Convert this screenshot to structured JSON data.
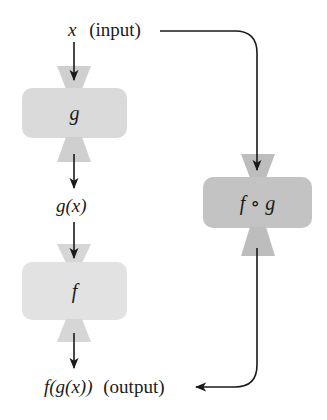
{
  "diagram": {
    "type": "function composition machine diagram",
    "input_label": {
      "var": "x",
      "note": "(input)"
    },
    "intermediate_label": "g(x)",
    "output_label": {
      "expr": "f(g(x))",
      "note": "(output)"
    },
    "machines": [
      {
        "id": "g",
        "label": "g",
        "color": "#dcdcdc"
      },
      {
        "id": "f",
        "label": "f",
        "color": "#e3e3e3"
      },
      {
        "id": "fog",
        "label": "f ∘ g",
        "color": "#c4c4c4"
      }
    ],
    "edges": [
      {
        "from": "x (input)",
        "to": "g"
      },
      {
        "from": "g",
        "to": "g(x)"
      },
      {
        "from": "g(x)",
        "to": "f"
      },
      {
        "from": "f",
        "to": "f(g(x)) (output)"
      },
      {
        "from": "x (input)",
        "to": "f ∘ g"
      },
      {
        "from": "f ∘ g",
        "to": "f(g(x)) (output)"
      }
    ],
    "colors": {
      "line": "#1a1a1a",
      "funnel": "#c8c8c8"
    }
  }
}
